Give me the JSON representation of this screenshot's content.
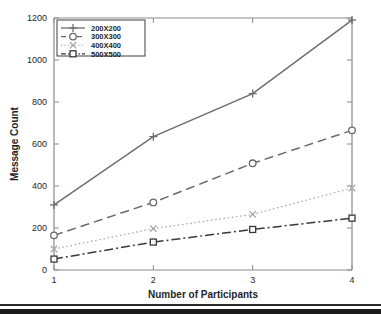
{
  "chart_data": {
    "type": "line",
    "title": "",
    "xlabel": "Number of Participants",
    "ylabel": "Message Count",
    "x": [
      1,
      2,
      3,
      4
    ],
    "xtick_labels": [
      "1",
      "2",
      "3",
      "4"
    ],
    "ytick_labels": [
      "0",
      "200",
      "400",
      "600",
      "800",
      "1000",
      "1200"
    ],
    "ytick_values": [
      0,
      200,
      400,
      600,
      800,
      1000,
      1200
    ],
    "xlim": [
      1,
      4
    ],
    "ylim": [
      0,
      1200
    ],
    "grid": false,
    "legend_position": "top-left",
    "series": [
      {
        "name": "200X200",
        "values": [
          310,
          635,
          840,
          1190
        ],
        "linestyle": "solid",
        "marker": "plus",
        "color": "#6e6e6e"
      },
      {
        "name": "300X300",
        "values": [
          165,
          322,
          508,
          665
        ],
        "linestyle": "dashed",
        "marker": "circle",
        "color": "#6a6a6a"
      },
      {
        "name": "400X400",
        "values": [
          100,
          197,
          265,
          390
        ],
        "linestyle": "dotted",
        "marker": "x",
        "color": "#a8a8a8"
      },
      {
        "name": "500X500",
        "values": [
          52,
          133,
          193,
          247
        ],
        "linestyle": "dashdot",
        "marker": "square",
        "color": "#3a3a3a"
      }
    ]
  },
  "axis": {
    "x_title": "Number of Participants",
    "y_title": "Message Count"
  },
  "legend": {
    "entries": [
      {
        "label": "200X200"
      },
      {
        "label": "300X300"
      },
      {
        "label": "400X400"
      },
      {
        "label": "500X500"
      }
    ]
  }
}
